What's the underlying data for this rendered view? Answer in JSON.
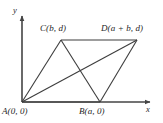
{
  "figure": {
    "type": "geometry-diagram",
    "shape": "parallelogram-with-diagonals",
    "background_color": "#ffffff",
    "line_color": "#3d3d3d",
    "axis_color": "#444444",
    "text_color": "#262626"
  },
  "axes": {
    "x_label": "x",
    "y_label": "y",
    "origin_px": {
      "x": 22,
      "y": 102
    },
    "x_axis_end_px": {
      "x": 152,
      "y": 102
    },
    "y_axis_end_px": {
      "x": 22,
      "y": 14
    }
  },
  "vertices": [
    {
      "id": "A",
      "label": "A(0, 0)",
      "coords": "(0, 0)",
      "px": {
        "x": 22,
        "y": 102
      }
    },
    {
      "id": "B",
      "label": "B(a, 0)",
      "coords": "(a, 0)",
      "px": {
        "x": 100,
        "y": 102
      }
    },
    {
      "id": "C",
      "label": "C(b, d)",
      "coords": "(b, d)",
      "px": {
        "x": 61,
        "y": 40
      }
    },
    {
      "id": "D",
      "label": "D(a + b, d)",
      "coords": "(a + b, d)",
      "px": {
        "x": 137,
        "y": 40
      }
    }
  ],
  "edges": [
    {
      "from": "A",
      "to": "B",
      "kind": "side"
    },
    {
      "from": "B",
      "to": "D",
      "kind": "side"
    },
    {
      "from": "D",
      "to": "C",
      "kind": "side"
    },
    {
      "from": "C",
      "to": "A",
      "kind": "side"
    },
    {
      "from": "A",
      "to": "D",
      "kind": "diagonal"
    },
    {
      "from": "B",
      "to": "C",
      "kind": "diagonal"
    }
  ]
}
